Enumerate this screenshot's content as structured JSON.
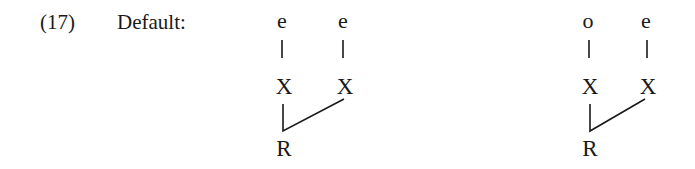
{
  "example": {
    "number": "(17)",
    "label": "Default:"
  },
  "trees": [
    {
      "top_left": "e",
      "top_right": "e",
      "mid_left": "X",
      "mid_right": "X",
      "root": "R"
    },
    {
      "top_left": "o",
      "top_right": "e",
      "mid_left": "X",
      "mid_right": "X",
      "root": "R"
    }
  ]
}
